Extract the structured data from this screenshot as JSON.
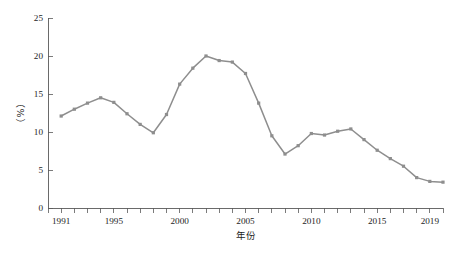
{
  "chart_data": {
    "type": "line",
    "title": "",
    "subtitle": "",
    "xlabel": "年份",
    "ylabel": "（%）",
    "xlim": [
      1990,
      2020
    ],
    "ylim": [
      0,
      25
    ],
    "grid": false,
    "legend": null,
    "legend_position": "none",
    "series_color": "#8e8e8e",
    "marker": "square",
    "x_tick_interval": 1,
    "x_tick_labels": [
      "1991",
      "1995",
      "2000",
      "2005",
      "2010",
      "2015",
      "2019"
    ],
    "x_tick_label_values": [
      1991,
      1995,
      2000,
      2005,
      2010,
      2015,
      2019
    ],
    "y_tick_labels": [
      "0",
      "5",
      "10",
      "15",
      "20",
      "25"
    ],
    "y_tick_values": [
      0,
      5,
      10,
      15,
      20,
      25
    ],
    "x": [
      1991,
      1992,
      1993,
      1994,
      1995,
      1996,
      1997,
      1998,
      1999,
      2000,
      2001,
      2002,
      2003,
      2004,
      2005,
      2006,
      2007,
      2008,
      2009,
      2010,
      2011,
      2012,
      2013,
      2014,
      2015,
      2016,
      2017,
      2018,
      2019,
      2020
    ],
    "values": [
      12.1,
      13.0,
      13.8,
      14.5,
      13.9,
      12.4,
      11.0,
      9.9,
      12.3,
      16.3,
      18.4,
      20.0,
      19.4,
      19.2,
      17.7,
      13.8,
      9.5,
      7.1,
      8.2,
      9.8,
      9.6,
      10.1,
      10.4,
      9.0,
      7.6,
      6.5,
      5.5,
      4.0,
      3.5,
      3.4
    ],
    "series": [
      {
        "name": "",
        "values": [
          12.1,
          13.0,
          13.8,
          14.5,
          13.9,
          12.4,
          11.0,
          9.9,
          12.3,
          16.3,
          18.4,
          20.0,
          19.4,
          19.2,
          17.7,
          13.8,
          9.5,
          7.1,
          8.2,
          9.8,
          9.6,
          10.1,
          10.4,
          9.0,
          7.6,
          6.5,
          5.5,
          4.0,
          3.5,
          3.4
        ]
      }
    ],
    "annotations": []
  },
  "caption": {
    "text": ""
  }
}
